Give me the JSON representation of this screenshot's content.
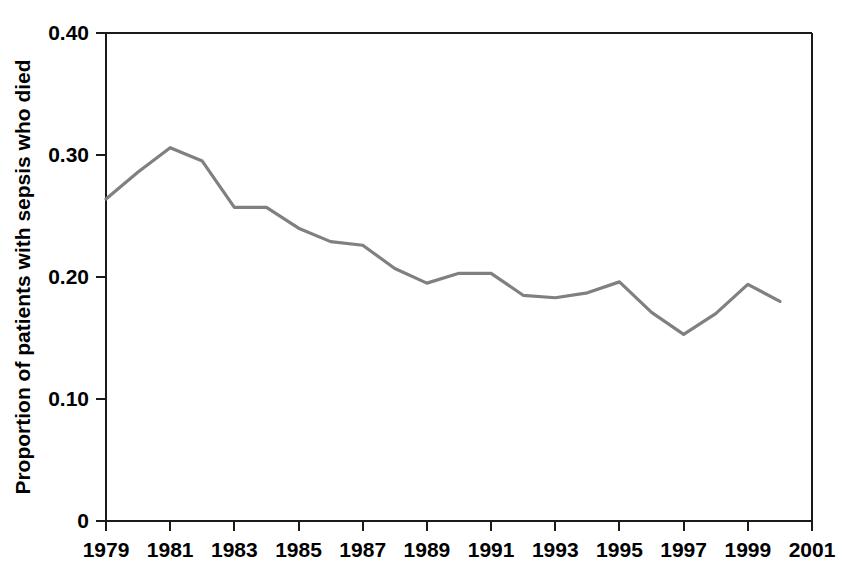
{
  "chart_data": {
    "type": "line",
    "title": "",
    "subtitle": "",
    "xlabel": "",
    "ylabel": "Proportion of patients with sepsis who died",
    "xlim": [
      1979,
      2001
    ],
    "ylim": [
      0,
      0.4
    ],
    "grid": false,
    "legend": false,
    "legend_position": "none",
    "line_color": "#808080",
    "axis_color": "#1a1a1a",
    "background_color": "#ffffff",
    "x_ticks": [
      {
        "value": 1979,
        "label": "1979"
      },
      {
        "value": 1981,
        "label": "1981"
      },
      {
        "value": 1983,
        "label": "1983"
      },
      {
        "value": 1985,
        "label": "1985"
      },
      {
        "value": 1987,
        "label": "1987"
      },
      {
        "value": 1989,
        "label": "1989"
      },
      {
        "value": 1991,
        "label": "1991"
      },
      {
        "value": 1993,
        "label": "1993"
      },
      {
        "value": 1995,
        "label": "1995"
      },
      {
        "value": 1997,
        "label": "1997"
      },
      {
        "value": 1999,
        "label": "1999"
      },
      {
        "value": 2001,
        "label": "2001"
      }
    ],
    "y_ticks": [
      {
        "value": 0.4,
        "label": "0.40"
      },
      {
        "value": 0.3,
        "label": "0.30"
      },
      {
        "value": 0.2,
        "label": "0.20"
      },
      {
        "value": 0.1,
        "label": "0.10"
      },
      {
        "value": 0,
        "label": "0"
      }
    ],
    "x": [
      1979,
      1980,
      1981,
      1982,
      1983,
      1984,
      1985,
      1986,
      1987,
      1988,
      1989,
      1990,
      1991,
      1992,
      1993,
      1994,
      1995,
      1996,
      1997,
      1998,
      1999,
      2000
    ],
    "series": [
      {
        "name": "Proportion of patients with sepsis who died",
        "values": [
          0.264,
          0.286,
          0.306,
          0.295,
          0.257,
          0.257,
          0.24,
          0.229,
          0.226,
          0.207,
          0.195,
          0.203,
          0.203,
          0.185,
          0.183,
          0.187,
          0.196,
          0.171,
          0.153,
          0.17,
          0.194,
          0.18
        ]
      }
    ],
    "annotations": []
  }
}
